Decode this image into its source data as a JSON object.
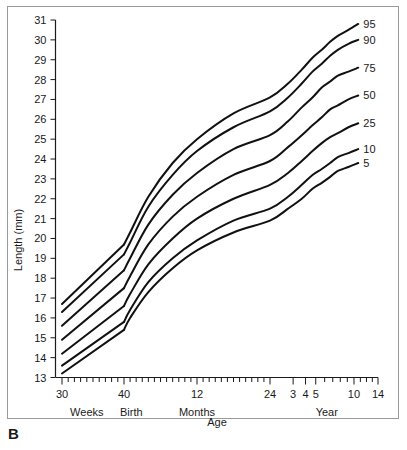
{
  "panel": {
    "letter": "B"
  },
  "chart_data": {
    "type": "line",
    "title": "",
    "xlabel": "Age",
    "ylabel": "Length (mm)",
    "ylim": [
      13,
      31
    ],
    "grid": false,
    "legend_position": "right-of-curves",
    "y_ticks": [
      13,
      14,
      15,
      16,
      17,
      18,
      19,
      20,
      21,
      22,
      23,
      24,
      25,
      26,
      27,
      28,
      29,
      30,
      31
    ],
    "x_tick_labels": [
      "30",
      "40",
      "12",
      "24",
      "3",
      "4",
      "5",
      "10",
      "14"
    ],
    "x_group_labels": [
      "Weeks",
      "Birth",
      "Months",
      "Year"
    ],
    "x_axis_units_note": "Weeks (30-40 gestational), then Months (to 24), then Years (3-14)",
    "series": [
      {
        "name": "95",
        "label": "95",
        "x": [
          30,
          40,
          41,
          44,
          48,
          52,
          58,
          64,
          72,
          84,
          96,
          108,
          120,
          132,
          150,
          168
        ],
        "values": [
          16.7,
          19.7,
          20.3,
          22.1,
          23.8,
          25.0,
          26.3,
          27.1,
          27.8,
          28.5,
          29.1,
          29.5,
          29.9,
          30.2,
          30.5,
          30.8
        ]
      },
      {
        "name": "90",
        "label": "90",
        "x": [
          30,
          40,
          41,
          44,
          48,
          52,
          58,
          64,
          72,
          84,
          96,
          108,
          120,
          132,
          150,
          168
        ],
        "values": [
          16.3,
          19.2,
          19.8,
          21.6,
          23.2,
          24.4,
          25.6,
          26.4,
          27.1,
          27.8,
          28.4,
          28.8,
          29.2,
          29.5,
          29.8,
          30.0
        ]
      },
      {
        "name": "75",
        "label": "75",
        "x": [
          30,
          40,
          41,
          44,
          48,
          52,
          58,
          64,
          72,
          84,
          96,
          108,
          120,
          132,
          150,
          168
        ],
        "values": [
          15.6,
          18.4,
          19.0,
          20.7,
          22.2,
          23.3,
          24.5,
          25.2,
          25.9,
          26.6,
          27.1,
          27.6,
          27.9,
          28.2,
          28.4,
          28.6
        ]
      },
      {
        "name": "50",
        "label": "50",
        "x": [
          30,
          40,
          41,
          44,
          48,
          52,
          58,
          64,
          72,
          84,
          96,
          108,
          120,
          132,
          150,
          168
        ],
        "values": [
          14.9,
          17.5,
          18.1,
          19.7,
          21.1,
          22.1,
          23.2,
          23.9,
          24.6,
          25.2,
          25.7,
          26.1,
          26.5,
          26.7,
          27.0,
          27.2
        ]
      },
      {
        "name": "25",
        "label": "25",
        "x": [
          30,
          40,
          41,
          44,
          48,
          52,
          58,
          64,
          72,
          84,
          96,
          108,
          120,
          132,
          150,
          168
        ],
        "values": [
          14.2,
          16.6,
          17.2,
          18.7,
          20.0,
          21.0,
          22.0,
          22.7,
          23.3,
          23.9,
          24.4,
          24.8,
          25.1,
          25.3,
          25.6,
          25.8
        ]
      },
      {
        "name": "10",
        "label": "10",
        "x": [
          30,
          40,
          41,
          44,
          48,
          52,
          58,
          64,
          72,
          84,
          96,
          108,
          120,
          132,
          150,
          168
        ],
        "values": [
          13.6,
          15.8,
          16.4,
          17.8,
          19.0,
          19.9,
          20.9,
          21.5,
          22.1,
          22.7,
          23.2,
          23.5,
          23.8,
          24.1,
          24.3,
          24.5
        ]
      },
      {
        "name": "5",
        "label": "5",
        "x": [
          30,
          40,
          41,
          44,
          48,
          52,
          58,
          64,
          72,
          84,
          96,
          108,
          120,
          132,
          150,
          168
        ],
        "values": [
          13.2,
          15.4,
          16.0,
          17.3,
          18.5,
          19.4,
          20.3,
          20.9,
          21.5,
          22.0,
          22.5,
          22.8,
          23.1,
          23.4,
          23.6,
          23.8
        ]
      }
    ]
  }
}
